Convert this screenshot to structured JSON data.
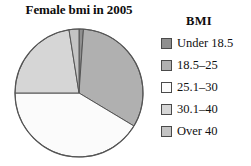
{
  "chart_data": {
    "type": "pie",
    "title": "Female bmi in 2005",
    "legend_title": "BMI",
    "legend_position": "right",
    "categories": [
      "Under 18.5",
      "18.5–25",
      "25.1–30",
      "30.1–40",
      "Over 40"
    ],
    "values": [
      3,
      33,
      41,
      22,
      1
    ],
    "unit": "percent",
    "colors": [
      "#8f8f8f",
      "#b0b0b0",
      "#fbfbfb",
      "#d6d6d6",
      "#c4c4c4"
    ],
    "slice_start_angles_deg": [
      0,
      4,
      121,
      270,
      351
    ],
    "slice_end_angles_deg": [
      4,
      121,
      270,
      351,
      360
    ],
    "start_angle_deg": 0,
    "direction": "clockwise",
    "xlabel": "",
    "ylabel": "",
    "grid": false,
    "outline_color": "#555555",
    "slices": [
      {
        "label": "Under 18.5",
        "value": 3,
        "color": "#8f8f8f"
      },
      {
        "label": "18.5–25",
        "value": 33,
        "color": "#b0b0b0"
      },
      {
        "label": "25.1–30",
        "value": 41,
        "color": "#fbfbfb"
      },
      {
        "label": "30.1–40",
        "value": 22,
        "color": "#d6d6d6"
      },
      {
        "label": "Over 40",
        "value": 1,
        "color": "#c4c4c4"
      }
    ]
  },
  "legend": {
    "title": "BMI",
    "items": [
      {
        "label": "Under 18.5",
        "color": "#8f8f8f"
      },
      {
        "label": "18.5–25",
        "color": "#b0b0b0"
      },
      {
        "label": "25.1–30",
        "color": "#fbfbfb"
      },
      {
        "label": "30.1–40",
        "color": "#d6d6d6"
      },
      {
        "label": "Over 40",
        "color": "#c4c4c4"
      }
    ]
  },
  "figure": {
    "title": "Female bmi in 2005"
  }
}
